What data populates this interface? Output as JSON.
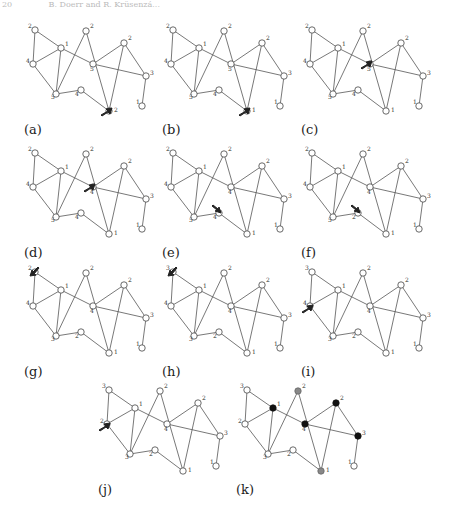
{
  "header": {
    "page_number": "20",
    "authors": "B. Doerr and R. Krüsenzá..."
  },
  "graph": {
    "nodes": [
      {
        "id": "tl",
        "x": 35,
        "y": 30,
        "lx": -7,
        "ly": -2
      },
      {
        "id": "n1",
        "x": 61,
        "y": 48,
        "lx": 4,
        "ly": -2
      },
      {
        "id": "l4",
        "x": 33,
        "y": 64,
        "lx": -7,
        "ly": -1
      },
      {
        "id": "top",
        "x": 86,
        "y": 31,
        "lx": 4,
        "ly": -3
      },
      {
        "id": "ctr",
        "x": 93,
        "y": 64,
        "lx": -3,
        "ly": 7
      },
      {
        "id": "rt",
        "x": 124,
        "y": 43,
        "lx": 4,
        "ly": -3
      },
      {
        "id": "r3",
        "x": 146,
        "y": 76,
        "lx": 4,
        "ly": -1
      },
      {
        "id": "b3",
        "x": 56,
        "y": 94,
        "lx": -5,
        "ly": 5
      },
      {
        "id": "b4",
        "x": 81,
        "y": 90,
        "lx": -6,
        "ly": 6
      },
      {
        "id": "bot",
        "x": 109,
        "y": 111,
        "lx": 5,
        "ly": 1
      },
      {
        "id": "fr",
        "x": 142,
        "y": 106,
        "lx": -6,
        "ly": -2
      }
    ],
    "edges": [
      [
        "tl",
        "n1"
      ],
      [
        "tl",
        "l4"
      ],
      [
        "l4",
        "n1"
      ],
      [
        "l4",
        "b3"
      ],
      [
        "n1",
        "b3"
      ],
      [
        "n1",
        "ctr"
      ],
      [
        "b3",
        "top"
      ],
      [
        "top",
        "bot"
      ],
      [
        "ctr",
        "rt"
      ],
      [
        "ctr",
        "r3"
      ],
      [
        "rt",
        "r3"
      ],
      [
        "rt",
        "bot"
      ],
      [
        "r3",
        "fr"
      ],
      [
        "b3",
        "b4"
      ],
      [
        "b4",
        "bot"
      ]
    ]
  },
  "panels": [
    {
      "label": "(a)",
      "dx": 0,
      "dy": 0,
      "labels": {
        "tl": "2",
        "n1": "1",
        "l4": "4",
        "top": "2",
        "ctr": "5",
        "rt": "2",
        "r3": "3",
        "b3": "5",
        "b4": "4",
        "bot": "2",
        "fr": "1"
      },
      "arrow": {
        "x": 101,
        "y": 115,
        "dir": "ne"
      }
    },
    {
      "label": "(b)",
      "dx": 138,
      "dy": 0,
      "labels": {
        "tl": "2",
        "n1": "1",
        "l4": "4",
        "top": "2",
        "ctr": "5",
        "rt": "2",
        "r3": "3",
        "b3": "5",
        "b4": "4",
        "bot": "1",
        "fr": "1"
      },
      "arrow": {
        "x": 101,
        "y": 115,
        "dir": "ne"
      }
    },
    {
      "label": "(c)",
      "dx": 277,
      "dy": 0,
      "labels": {
        "tl": "2",
        "n1": "1",
        "l4": "4",
        "top": "2",
        "ctr": "5",
        "rt": "2",
        "r3": "3",
        "b3": "5",
        "b4": "4",
        "bot": "1",
        "fr": "1"
      },
      "arrow": {
        "x": 84,
        "y": 68,
        "dir": "ne"
      }
    },
    {
      "label": "(d)",
      "dx": 0,
      "dy": 123,
      "labels": {
        "tl": "2",
        "n1": "1",
        "l4": "4",
        "top": "2",
        "ctr": "4",
        "rt": "2",
        "r3": "3",
        "b3": "5",
        "b4": "4",
        "bot": "1",
        "fr": "1"
      },
      "arrow": {
        "x": 84,
        "y": 68,
        "dir": "ne"
      }
    },
    {
      "label": "(e)",
      "dx": 138,
      "dy": 123,
      "labels": {
        "tl": "2",
        "n1": "1",
        "l4": "4",
        "top": "2",
        "ctr": "4",
        "rt": "2",
        "r3": "3",
        "b3": "5",
        "b4": "4",
        "bot": "1",
        "fr": "1"
      },
      "arrow": {
        "x": 74,
        "y": 83,
        "dir": "se"
      }
    },
    {
      "label": "(f)",
      "dx": 277,
      "dy": 123,
      "labels": {
        "tl": "2",
        "n1": "1",
        "l4": "4",
        "top": "2",
        "ctr": "4",
        "rt": "2",
        "r3": "3",
        "b3": "5",
        "b4": "2",
        "bot": "1",
        "fr": "1"
      },
      "arrow": {
        "x": 74,
        "y": 83,
        "dir": "se"
      }
    },
    {
      "label": "(g)",
      "dx": 0,
      "dy": 242,
      "labels": {
        "tl": "2",
        "n1": "1",
        "l4": "4",
        "top": "2",
        "ctr": "4",
        "rt": "2",
        "r3": "3",
        "b3": "3",
        "b4": "2",
        "bot": "1",
        "fr": "1"
      },
      "arrow": {
        "x": 38,
        "y": 25,
        "dir": "sw"
      }
    },
    {
      "label": "(h)",
      "dx": 138,
      "dy": 242,
      "labels": {
        "tl": "3",
        "n1": "1",
        "l4": "4",
        "top": "2",
        "ctr": "4",
        "rt": "2",
        "r3": "3",
        "b3": "3",
        "b4": "2",
        "bot": "1",
        "fr": "1"
      },
      "arrow": {
        "x": 38,
        "y": 25,
        "dir": "sw"
      }
    },
    {
      "label": "(i)",
      "dx": 277,
      "dy": 242,
      "labels": {
        "tl": "3",
        "n1": "1",
        "l4": "4",
        "top": "2",
        "ctr": "4",
        "rt": "2",
        "r3": "3",
        "b3": "3",
        "b4": "2",
        "bot": "1",
        "fr": "1"
      },
      "arrow": {
        "x": 25,
        "y": 70,
        "dir": "ne"
      }
    },
    {
      "label": "(j)",
      "dx": 74,
      "dy": 360,
      "labels": {
        "tl": "3",
        "n1": "1",
        "l4": "2",
        "top": "2",
        "ctr": "4",
        "rt": "2",
        "r3": "3",
        "b3": "3",
        "b4": "2",
        "bot": "1",
        "fr": "1"
      },
      "arrow": {
        "x": 25,
        "y": 70,
        "dir": "ne"
      }
    },
    {
      "label": "(k)",
      "dx": 212,
      "dy": 360,
      "labels": {
        "tl": "3",
        "n1": "1",
        "l4": "2",
        "top": "2",
        "ctr": "4",
        "rt": "2",
        "r3": "3",
        "b3": "3",
        "b4": "2",
        "bot": "1",
        "fr": "1"
      },
      "fills": {
        "n1": "black",
        "ctr": "black",
        "rt": "black",
        "r3": "black",
        "top": "gray",
        "bot": "gray"
      }
    }
  ]
}
